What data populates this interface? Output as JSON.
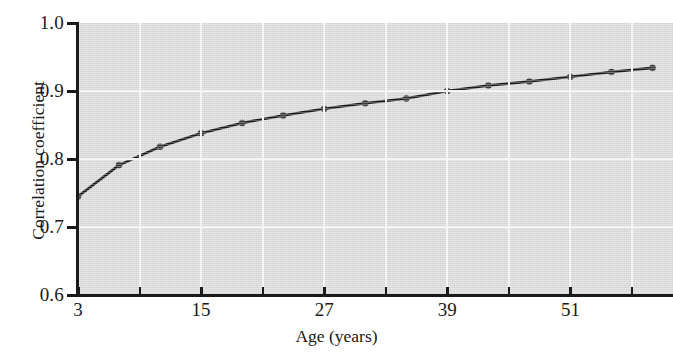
{
  "chart_data": {
    "type": "line",
    "title": "",
    "subtitle": "",
    "xlabel": "Age (years)",
    "ylabel": "Correlation coefficient",
    "xlim": [
      3,
      61
    ],
    "ylim": [
      0.6,
      1.0
    ],
    "xticks": [
      3,
      9,
      15,
      21,
      27,
      33,
      39,
      45,
      51,
      57
    ],
    "xticklabels": [
      "3",
      "",
      "15",
      "",
      "27",
      "",
      "39",
      "",
      "51",
      ""
    ],
    "yticks": [
      0.6,
      0.7,
      0.8,
      0.9,
      1.0
    ],
    "yticklabels": [
      "0.6",
      "0.7",
      "0.8",
      "0.9",
      "1.0"
    ],
    "grid": true,
    "grid_color": "#f4f4f4",
    "plot_bgcolor": "#dcdcdc",
    "legend": null,
    "marker": "circle",
    "line_color": "#1a1a1a",
    "series": [
      {
        "name": "Correlation coefficient vs age",
        "x": [
          3,
          7,
          11,
          15,
          19,
          23,
          27,
          31,
          35,
          39,
          43,
          47,
          51,
          55,
          59
        ],
        "values": [
          0.745,
          0.791,
          0.818,
          0.838,
          0.853,
          0.864,
          0.874,
          0.882,
          0.889,
          0.9,
          0.908,
          0.914,
          0.921,
          0.928,
          0.934
        ]
      }
    ],
    "annotations": []
  },
  "axes": {
    "y_title": "Correlation coefficient",
    "x_title": "Age (years)"
  }
}
